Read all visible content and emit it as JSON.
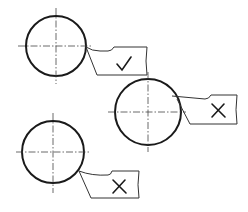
{
  "diagram": {
    "title": "",
    "colors": {
      "line": "#1a1a1a",
      "background": "#ffffff"
    },
    "cases": [
      {
        "id": "case-1",
        "workpiece": {
          "cx": 56,
          "cy": 46,
          "r": 30
        },
        "tool_height": "on-center",
        "verdict": "correct",
        "mark_symbol": "check-mark"
      },
      {
        "id": "case-2",
        "workpiece": {
          "cx": 148,
          "cy": 112,
          "r": 33
        },
        "tool_height": "above-center",
        "verdict": "incorrect",
        "mark_symbol": "x-mark"
      },
      {
        "id": "case-3",
        "workpiece": {
          "cx": 53,
          "cy": 152,
          "r": 31
        },
        "tool_height": "below-center",
        "verdict": "incorrect",
        "mark_symbol": "x-mark"
      }
    ]
  }
}
